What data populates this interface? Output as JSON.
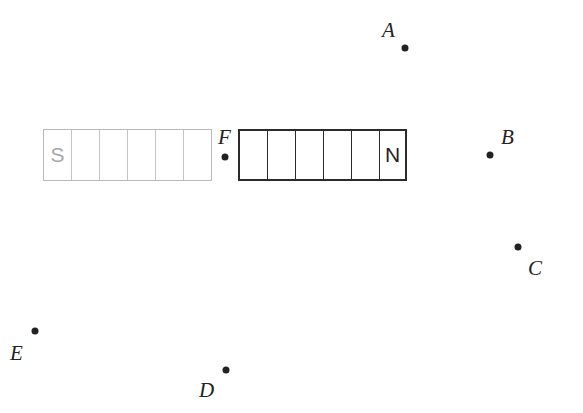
{
  "diagram": {
    "ghost_magnet": {
      "cells": [
        "S",
        "",
        "",
        "",
        "",
        ""
      ],
      "color": "#b9b9b9"
    },
    "solid_magnet": {
      "cells": [
        "",
        "",
        "",
        "",
        "",
        "N"
      ],
      "color": "#2b2b2b"
    },
    "points": [
      {
        "id": "A",
        "label": "A"
      },
      {
        "id": "B",
        "label": "B"
      },
      {
        "id": "C",
        "label": "C"
      },
      {
        "id": "D",
        "label": "D"
      },
      {
        "id": "E",
        "label": "E"
      },
      {
        "id": "F",
        "label": "F"
      }
    ]
  }
}
